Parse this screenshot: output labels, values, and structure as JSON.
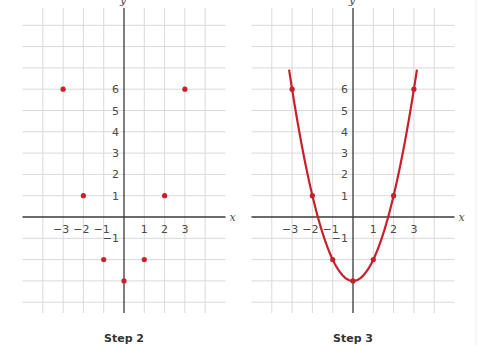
{
  "chart_data": [
    {
      "type": "scatter",
      "title": "Step 2",
      "xlabel": "x",
      "ylabel": "y",
      "x_ticks": [
        "−3",
        "−2",
        "−1",
        "1",
        "2",
        "3"
      ],
      "y_ticks": [
        "−1",
        "1",
        "2",
        "3",
        "4",
        "5",
        "6"
      ],
      "xlim": [
        -5,
        5
      ],
      "ylim": [
        -4,
        9
      ],
      "grid": true,
      "points": [
        {
          "x": -3,
          "y": 6
        },
        {
          "x": -2,
          "y": 1
        },
        {
          "x": -1,
          "y": -2
        },
        {
          "x": 0,
          "y": -3
        },
        {
          "x": 1,
          "y": -2
        },
        {
          "x": 2,
          "y": 1
        },
        {
          "x": 3,
          "y": 6
        }
      ],
      "point_color": "#c8202a"
    },
    {
      "type": "line",
      "title": "Step 3",
      "xlabel": "x",
      "ylabel": "y",
      "x_ticks": [
        "−3",
        "−2",
        "−1",
        "1",
        "2",
        "3"
      ],
      "y_ticks": [
        "−1",
        "1",
        "2",
        "3",
        "4",
        "5",
        "6"
      ],
      "xlim": [
        -5,
        5
      ],
      "ylim": [
        -4,
        9
      ],
      "grid": true,
      "curve": "y = x^2 - 3",
      "curve_x_range": [
        -3.15,
        3.15
      ],
      "points": [
        {
          "x": -3,
          "y": 6
        },
        {
          "x": -2,
          "y": 1
        },
        {
          "x": -1,
          "y": -2
        },
        {
          "x": 0,
          "y": -3
        },
        {
          "x": 1,
          "y": -2
        },
        {
          "x": 2,
          "y": 1
        },
        {
          "x": 3,
          "y": 6
        }
      ],
      "color": "#c8202a"
    }
  ],
  "captions": {
    "left": "Step 2",
    "right": "Step 3"
  },
  "axis_labels": {
    "x": "x",
    "y": "y"
  }
}
